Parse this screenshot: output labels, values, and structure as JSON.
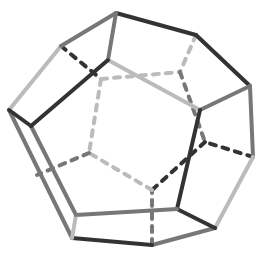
{
  "figure": {
    "width": 263,
    "height": 254,
    "colors": {
      "dark": "#333333",
      "mid": "#777777",
      "light": "#bbbbbb"
    }
  },
  "vertices": {
    "A": [
      116,
      13
    ],
    "B": [
      196,
      35
    ],
    "C": [
      250,
      86
    ],
    "D": [
      253,
      157
    ],
    "E": [
      215,
      228
    ],
    "F": [
      152,
      245
    ],
    "G": [
      72,
      238
    ],
    "H": [
      9,
      110
    ],
    "I": [
      61,
      46
    ],
    "J": [
      108,
      60
    ],
    "K": [
      200,
      110
    ],
    "L": [
      177,
      209
    ],
    "M": [
      76,
      215
    ],
    "N": [
      31,
      126
    ],
    "P": [
      101,
      79
    ],
    "Q": [
      180,
      72
    ],
    "R": [
      205,
      142
    ],
    "S": [
      152,
      190
    ],
    "T": [
      89,
      153
    ],
    "U": [
      37,
      175
    ]
  },
  "edges": [
    {
      "from": "A",
      "to": "B",
      "style": "solid",
      "shade": "dark"
    },
    {
      "from": "B",
      "to": "C",
      "style": "solid",
      "shade": "dark"
    },
    {
      "from": "C",
      "to": "D",
      "style": "solid",
      "shade": "mid"
    },
    {
      "from": "D",
      "to": "E",
      "style": "solid",
      "shade": "light"
    },
    {
      "from": "E",
      "to": "F",
      "style": "solid",
      "shade": "mid"
    },
    {
      "from": "F",
      "to": "G",
      "style": "solid",
      "shade": "dark"
    },
    {
      "from": "G",
      "to": "H",
      "style": "solid",
      "shade": "mid"
    },
    {
      "from": "H",
      "to": "I",
      "style": "solid",
      "shade": "light"
    },
    {
      "from": "I",
      "to": "A",
      "style": "solid",
      "shade": "mid"
    },
    {
      "from": "A",
      "to": "J",
      "style": "solid",
      "shade": "mid"
    },
    {
      "from": "J",
      "to": "K",
      "style": "solid",
      "shade": "light"
    },
    {
      "from": "C",
      "to": "K",
      "style": "solid",
      "shade": "mid"
    },
    {
      "from": "K",
      "to": "L",
      "style": "solid",
      "shade": "dark"
    },
    {
      "from": "E",
      "to": "L",
      "style": "solid",
      "shade": "dark"
    },
    {
      "from": "L",
      "to": "M",
      "style": "solid",
      "shade": "mid"
    },
    {
      "from": "G",
      "to": "M",
      "style": "solid",
      "shade": "light"
    },
    {
      "from": "M",
      "to": "N",
      "style": "solid",
      "shade": "mid"
    },
    {
      "from": "H",
      "to": "N",
      "style": "solid",
      "shade": "dark"
    },
    {
      "from": "N",
      "to": "J",
      "style": "solid",
      "shade": "dark"
    },
    {
      "from": "I",
      "to": "P",
      "style": "dashed",
      "shade": "dark"
    },
    {
      "from": "P",
      "to": "Q",
      "style": "dashed",
      "shade": "light"
    },
    {
      "from": "B",
      "to": "Q",
      "style": "dashed",
      "shade": "light"
    },
    {
      "from": "Q",
      "to": "R",
      "style": "dashed",
      "shade": "mid"
    },
    {
      "from": "D",
      "to": "R",
      "style": "dashed",
      "shade": "dark"
    },
    {
      "from": "R",
      "to": "S",
      "style": "dashed",
      "shade": "dark"
    },
    {
      "from": "F",
      "to": "S",
      "style": "dashed",
      "shade": "mid"
    },
    {
      "from": "S",
      "to": "T",
      "style": "dashed",
      "shade": "light"
    },
    {
      "from": "P",
      "to": "T",
      "style": "dashed",
      "shade": "light"
    },
    {
      "from": "T",
      "to": "U",
      "style": "dashed",
      "shade": "mid"
    }
  ]
}
